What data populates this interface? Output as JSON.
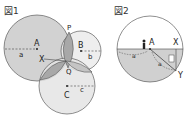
{
  "figures": [
    {
      "title": "図1",
      "points": {
        "A": "A",
        "B": "B",
        "C": "C",
        "P": "P",
        "Q": "Q",
        "X": "X"
      },
      "radii": {
        "a": "a",
        "b": "b",
        "c": "c"
      }
    },
    {
      "title": "図2",
      "points": {
        "A": "A",
        "X": "X",
        "Y": "Y"
      },
      "radii": {
        "a1": "a",
        "a2": "a"
      },
      "box_label": "②"
    }
  ],
  "colors": {
    "circleA": "#d2d2d2",
    "circleB": "#ececec",
    "circleC": "#e4e4e4",
    "overlap": "#a8a8a8",
    "stroke": "#444444",
    "lower_half": "#d0d0d0"
  }
}
